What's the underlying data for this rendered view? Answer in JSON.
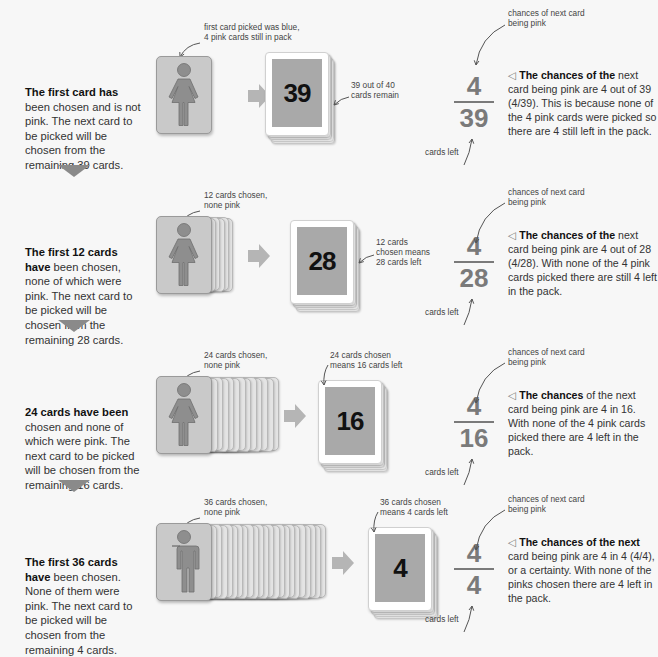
{
  "rows": [
    {
      "desc_bold": "The first card has",
      "desc_rest": " been chosen and is not pink. The next card to be picked will be chosen from the remaining 39 cards.",
      "figure_note": [
        "first card picked was blue,",
        "4 pink cards still in pack"
      ],
      "figure_type": "woman",
      "stack_count": 0,
      "pack_number": "39",
      "pack_note": [
        "39 out of 40",
        "cards remain"
      ],
      "pack_note_side": "right",
      "fraction": {
        "numerator": "4",
        "denominator": "39"
      },
      "chance_note": [
        "chances of next card",
        "being pink"
      ],
      "cards_left_note": "cards left",
      "explain_bold": "The chances of the",
      "explain_rest": " next card being pink are 4 out of 39 (4/39). This is because none of the 4 pink cards were picked so there are 4 still left in the pack."
    },
    {
      "desc_bold": "The first 12 cards have",
      "desc_rest": " been chosen, none of which were pink. The next card to be picked will be chosen from the remaining 28 cards.",
      "figure_note": [
        "12 cards chosen,",
        "none pink"
      ],
      "figure_type": "woman",
      "stack_count": 5,
      "pack_number": "28",
      "pack_note": [
        "12 cards",
        "chosen means",
        "28 cards left"
      ],
      "pack_note_side": "right",
      "fraction": {
        "numerator": "4",
        "denominator": "28"
      },
      "chance_note": [
        "chances of next card",
        "being pink"
      ],
      "cards_left_note": "cards left",
      "explain_bold": "The chances of the",
      "explain_rest": " next card being pink are 4 out of 28 (4/28). With none of the 4 pink cards picked there are still 4 left in the pack."
    },
    {
      "desc_bold": "24 cards have been",
      "desc_rest": " chosen and none of which were pink. The next card to be picked will be chosen from the remaining 16 cards.",
      "figure_note": [
        "24 cards chosen,",
        "none pink"
      ],
      "figure_type": "woman",
      "stack_count": 12,
      "pack_number": "16",
      "pack_note": [
        "24 cards chosen",
        "means 16 cards left"
      ],
      "pack_note_side": "top",
      "fraction": {
        "numerator": "4",
        "denominator": "16"
      },
      "chance_note": [
        "chances of next card",
        "being pink"
      ],
      "cards_left_note": "cards left",
      "explain_bold": "The chances",
      "explain_rest": " of the next card being pink are 4 in 16. With none of the 4 pink cards picked there are 4 left in the pack."
    },
    {
      "desc_bold": "The first 36 cards have",
      "desc_rest": " been chosen. None of them were pink. The next card to be picked will be chosen from the remaining 4 cards.",
      "figure_note": [
        "36 cards chosen,",
        "none pink"
      ],
      "figure_type": "man",
      "stack_count": 22,
      "pack_number": "4",
      "pack_note": [
        "36 cards chosen",
        "means 4 cards left"
      ],
      "pack_note_side": "top",
      "fraction": {
        "numerator": "4",
        "denominator": "4"
      },
      "chance_note": [
        "chances of next card",
        "being pink"
      ],
      "cards_left_note": "cards left",
      "explain_bold": "The chances of the next",
      "explain_rest": " card being pink are 4 in 4 (4/4), or a certainty. With none of the pinks chosen there are 4 left in the pack."
    }
  ],
  "icons": {
    "woman": "woman-figure-icon",
    "man": "man-figure-icon",
    "flow_arrow": "right-arrow-icon",
    "step_down": "down-triangle-icon",
    "explain_marker": "◁"
  },
  "colors": {
    "background": "#f7f7f7",
    "figure_card": "#c9c9c9",
    "figure": "#8e8e8e",
    "number_face": "#a9a9a9",
    "fraction": "#7a7a7a",
    "flow_arrow": "#b5b5b5",
    "step_triangle": "#8a8a8a"
  }
}
